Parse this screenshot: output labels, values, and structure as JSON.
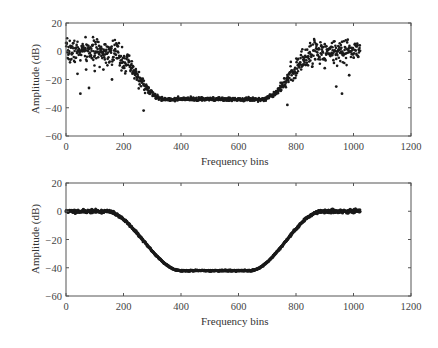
{
  "chart_data": [
    {
      "type": "scatter",
      "title": "",
      "xlabel": "Frequency bins",
      "ylabel": "Amplitude (dB)",
      "xlim": [
        0,
        1200
      ],
      "ylim": [
        -60,
        20
      ],
      "xticks": [
        0,
        200,
        400,
        600,
        800,
        1000,
        1200
      ],
      "yticks": [
        20,
        0,
        -20,
        -40,
        -60
      ],
      "grid": false,
      "legend": null,
      "marker": "dot",
      "description": "Noisy band-stop response: ~0 dB passband (bins 0-150 and 880-1024) with ~±8 dB scatter, transition bands 150-330 and 700-880, flat stopband ~-34 dB (bins 370-650). Outliers down to ~-30 dB in passbands.",
      "model": {
        "n_points": 1024,
        "pass_level": 0,
        "stop_level": -34,
        "fall_start": 150,
        "fall_end": 340,
        "rise_start": 680,
        "rise_end": 880,
        "pass_noise": 4,
        "stop_noise": 0.6,
        "transition_noise": 5,
        "seed": 7
      },
      "x": [
        0,
        50,
        100,
        150,
        200,
        250,
        300,
        350,
        400,
        450,
        500,
        550,
        600,
        650,
        700,
        750,
        800,
        850,
        900,
        950,
        1000,
        1024
      ],
      "y": [
        2,
        1,
        0,
        -2,
        -8,
        -18,
        -28,
        -33,
        -34,
        -34,
        -34,
        -34,
        -34,
        -33,
        -30,
        -24,
        -14,
        -4,
        0,
        1,
        2,
        2
      ],
      "outliers": [
        [
          40,
          -16
        ],
        [
          50,
          -30
        ],
        [
          70,
          -13
        ],
        [
          80,
          -26
        ],
        [
          100,
          -14
        ],
        [
          130,
          -13
        ],
        [
          160,
          -20
        ],
        [
          270,
          -42
        ],
        [
          770,
          -38
        ],
        [
          900,
          -12
        ],
        [
          940,
          -25
        ],
        [
          960,
          -30
        ],
        [
          985,
          -17
        ]
      ]
    },
    {
      "type": "scatter",
      "title": "",
      "xlabel": "Frequency bins",
      "ylabel": "Amplitude (dB)",
      "xlim": [
        0,
        1200
      ],
      "ylim": [
        -60,
        20
      ],
      "xticks": [
        0,
        200,
        400,
        600,
        800,
        1000,
        1200
      ],
      "yticks": [
        20,
        0,
        -20,
        -40,
        -60
      ],
      "grid": false,
      "legend": null,
      "marker": "dot",
      "description": "Smoothed band-stop response: flat ~0 dB passband (bins 0-140 and 890-1024), smooth transitions, flat stopband ~-42 dB (bins 420-620).",
      "model": {
        "n_points": 1024,
        "pass_level": 0,
        "stop_level": -42,
        "fall_start": 140,
        "fall_end": 400,
        "rise_start": 640,
        "rise_end": 890,
        "pass_noise": 0.6,
        "stop_noise": 0.2,
        "transition_noise": 0.5,
        "seed": 11
      },
      "x": [
        0,
        50,
        100,
        150,
        200,
        250,
        300,
        350,
        400,
        450,
        500,
        550,
        600,
        650,
        700,
        750,
        800,
        850,
        900,
        950,
        1000,
        1024
      ],
      "y": [
        0,
        0,
        0,
        -1,
        -8,
        -18,
        -28,
        -37,
        -41,
        -42,
        -42,
        -42,
        -42,
        -41,
        -36,
        -26,
        -14,
        -4,
        0,
        0,
        0,
        -1
      ],
      "outliers": []
    }
  ]
}
